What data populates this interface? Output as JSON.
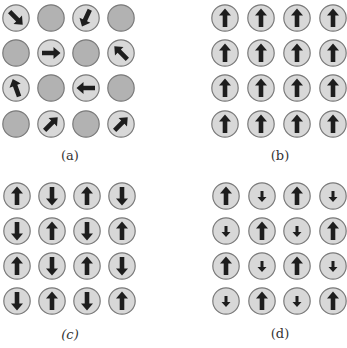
{
  "figure": {
    "colors": {
      "occupied_fill": "#d8d8d8",
      "empty_fill": "#b2b2b2",
      "border": "#7a7a7a",
      "arrow": "#1e1e1e",
      "label": "#333333"
    },
    "panels": [
      {
        "id": "a",
        "label": "(a)",
        "description": "paramagnetic - random spin orientations with vacant sites",
        "label_pos": [
          70,
          155
        ],
        "col_x": [
          16,
          51,
          86,
          121
        ],
        "row_y": [
          18,
          53,
          88,
          124
        ],
        "grid": [
          [
            {
              "angle": 135,
              "size": "large"
            },
            null,
            {
              "angle": 205,
              "size": "large"
            },
            null
          ],
          [
            null,
            {
              "angle": 90,
              "size": "large"
            },
            null,
            {
              "angle": 315,
              "size": "large"
            }
          ],
          [
            {
              "angle": 340,
              "size": "large"
            },
            null,
            {
              "angle": 270,
              "size": "large"
            },
            null
          ],
          [
            null,
            {
              "angle": 45,
              "size": "large"
            },
            null,
            {
              "angle": 45,
              "size": "large"
            }
          ]
        ]
      },
      {
        "id": "b",
        "label": "(b)",
        "description": "ferromagnetic - all spins up",
        "label_pos": [
          280,
          155
        ],
        "col_x": [
          225,
          261,
          297,
          333
        ],
        "row_y": [
          18,
          53,
          88,
          124
        ],
        "grid": [
          [
            {
              "angle": 0,
              "size": "large"
            },
            {
              "angle": 0,
              "size": "large"
            },
            {
              "angle": 0,
              "size": "large"
            },
            {
              "angle": 0,
              "size": "large"
            }
          ],
          [
            {
              "angle": 0,
              "size": "large"
            },
            {
              "angle": 0,
              "size": "large"
            },
            {
              "angle": 0,
              "size": "large"
            },
            {
              "angle": 0,
              "size": "large"
            }
          ],
          [
            {
              "angle": 0,
              "size": "large"
            },
            {
              "angle": 0,
              "size": "large"
            },
            {
              "angle": 0,
              "size": "large"
            },
            {
              "angle": 0,
              "size": "large"
            }
          ],
          [
            {
              "angle": 0,
              "size": "large"
            },
            {
              "angle": 0,
              "size": "large"
            },
            {
              "angle": 0,
              "size": "large"
            },
            {
              "angle": 0,
              "size": "large"
            }
          ]
        ]
      },
      {
        "id": "c",
        "label": "(c)",
        "italic": true,
        "description": "antiferromagnetic - alternating up/down equal spins",
        "label_pos": [
          70,
          334
        ],
        "col_x": [
          17,
          52,
          87,
          122
        ],
        "row_y": [
          196,
          231,
          266,
          301
        ],
        "grid": [
          [
            {
              "angle": 0,
              "size": "large"
            },
            {
              "angle": 180,
              "size": "large"
            },
            {
              "angle": 0,
              "size": "large"
            },
            {
              "angle": 180,
              "size": "large"
            }
          ],
          [
            {
              "angle": 180,
              "size": "large"
            },
            {
              "angle": 0,
              "size": "large"
            },
            {
              "angle": 180,
              "size": "large"
            },
            {
              "angle": 0,
              "size": "large"
            }
          ],
          [
            {
              "angle": 0,
              "size": "large"
            },
            {
              "angle": 180,
              "size": "large"
            },
            {
              "angle": 0,
              "size": "large"
            },
            {
              "angle": 180,
              "size": "large"
            }
          ],
          [
            {
              "angle": 180,
              "size": "large"
            },
            {
              "angle": 0,
              "size": "large"
            },
            {
              "angle": 180,
              "size": "large"
            },
            {
              "angle": 0,
              "size": "large"
            }
          ]
        ]
      },
      {
        "id": "d",
        "label": "(d)",
        "description": "ferrimagnetic - alternating large up / small down spins",
        "label_pos": [
          280,
          333
        ],
        "col_x": [
          226,
          262,
          297,
          333
        ],
        "row_y": [
          196,
          231,
          266,
          301
        ],
        "grid": [
          [
            {
              "angle": 0,
              "size": "large"
            },
            {
              "angle": 180,
              "size": "small"
            },
            {
              "angle": 0,
              "size": "large"
            },
            {
              "angle": 180,
              "size": "small"
            }
          ],
          [
            {
              "angle": 180,
              "size": "small"
            },
            {
              "angle": 0,
              "size": "large"
            },
            {
              "angle": 180,
              "size": "small"
            },
            {
              "angle": 0,
              "size": "large"
            }
          ],
          [
            {
              "angle": 0,
              "size": "large"
            },
            {
              "angle": 180,
              "size": "small"
            },
            {
              "angle": 0,
              "size": "large"
            },
            {
              "angle": 180,
              "size": "small"
            }
          ],
          [
            {
              "angle": 180,
              "size": "small"
            },
            {
              "angle": 0,
              "size": "large"
            },
            {
              "angle": 180,
              "size": "small"
            },
            {
              "angle": 0,
              "size": "large"
            }
          ]
        ]
      }
    ]
  }
}
